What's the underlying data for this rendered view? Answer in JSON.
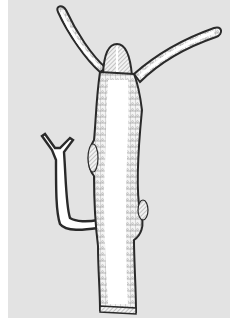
{
  "figure": {
    "colors": {
      "page": "#ffffff",
      "background": "#e3e3e3",
      "body_fill": "#ffffff",
      "ectoderm_stroke": "#2a2a2a",
      "cell_stroke": "#6a6a6a"
    },
    "parts": [
      "tentacle-left",
      "tentacle-right",
      "hypostome",
      "body-column",
      "bud",
      "basal-disc"
    ]
  }
}
